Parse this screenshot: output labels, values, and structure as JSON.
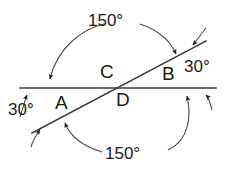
{
  "figure": {
    "stroke_color": "#2b2b2b",
    "text_color": "#1a1a1a",
    "background": "#ffffff",
    "lines": {
      "horizontal": {
        "name": "horizontal-line",
        "x1": 20,
        "y1": 88,
        "x2": 216,
        "y2": 88
      },
      "transversal": {
        "name": "diagonal-line",
        "x1": 32,
        "y1": 133,
        "x2": 206,
        "y2": 41
      }
    },
    "intersection": {
      "x": 115,
      "y": 88
    }
  },
  "point_labels": [
    {
      "id": "A",
      "text": "A",
      "x": 55,
      "y": 93
    },
    {
      "id": "B",
      "text": "B",
      "x": 162,
      "y": 64
    },
    {
      "id": "C",
      "text": "C",
      "x": 100,
      "y": 62
    },
    {
      "id": "D",
      "text": "D",
      "x": 116,
      "y": 90
    }
  ],
  "angle_labels": [
    {
      "id": "left-30",
      "text": "30°",
      "x": 8,
      "y": 101
    },
    {
      "id": "right-30",
      "text": "30°",
      "x": 184,
      "y": 58
    },
    {
      "id": "top-150",
      "text": "150°",
      "x": 88,
      "y": 12
    },
    {
      "id": "bottom-150",
      "text": "150°",
      "x": 105,
      "y": 145
    }
  ],
  "arcs": [
    {
      "id": "top-150-arc-left",
      "description": "arc from 150-degree label sweeping left down to horizontal line"
    },
    {
      "id": "top-150-arc-right",
      "description": "arc from 150-degree label sweeping right down to diagonal line"
    },
    {
      "id": "bottom-150-arc-left",
      "description": "arc from 150-degree label sweeping left up to diagonal line"
    },
    {
      "id": "bottom-150-arc-right",
      "description": "arc from 150-degree label sweeping right up to horizontal line"
    },
    {
      "id": "left-30-arc",
      "description": "short leader from left 30-degree label up to horizontal line"
    },
    {
      "id": "right-30-arc",
      "description": "short leader from right 30-degree label down to horizontal line"
    }
  ],
  "arrow_markers": [
    {
      "id": "arrow-horiz-left-outer",
      "target": "horizontal-line",
      "x": 27,
      "y": 88,
      "direction": "down"
    },
    {
      "id": "arrow-horiz-left-inner",
      "target": "horizontal-line",
      "x": 50,
      "y": 88,
      "direction": "down"
    },
    {
      "id": "arrow-horiz-right-inner",
      "target": "horizontal-line",
      "x": 184,
      "y": 88,
      "direction": "up"
    },
    {
      "id": "arrow-horiz-right-outer",
      "target": "horizontal-line",
      "x": 205,
      "y": 88,
      "direction": "up"
    },
    {
      "id": "arrow-diag-upper-inner",
      "target": "diagonal-line",
      "x": 170,
      "y": 59,
      "direction": "up-left"
    },
    {
      "id": "arrow-diag-upper-outer",
      "target": "diagonal-line",
      "x": 190,
      "y": 49,
      "direction": "up-left"
    },
    {
      "id": "arrow-diag-lower-inner",
      "target": "diagonal-line",
      "x": 60,
      "y": 118,
      "direction": "up-left"
    },
    {
      "id": "arrow-diag-lower-outer",
      "target": "diagonal-line",
      "x": 41,
      "y": 128,
      "direction": "up-left"
    }
  ]
}
